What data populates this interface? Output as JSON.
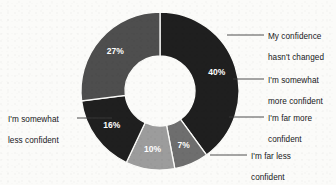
{
  "chart_data": {
    "type": "pie",
    "variant": "donut",
    "title": "",
    "subtitle": "",
    "xlabel": "",
    "ylabel": "",
    "legend_position": "callout-labels",
    "grid": false,
    "value_suffix": "%",
    "categories": [
      "My confidence hasn't changed",
      "I'm somewhat more confident",
      "I'm far more confident",
      "I'm far less confident",
      "I'm somewhat less confident"
    ],
    "values": [
      40,
      7,
      10,
      16,
      27
    ],
    "value_labels": [
      "40%",
      "7%",
      "10%",
      "16%",
      "27%"
    ],
    "colors": [
      "#1f1f1f",
      "#6e6e6e",
      "#9c9c9c",
      "#1f1f1f",
      "#4e4e4e"
    ],
    "slices": [
      {
        "label": "My confidence hasn't changed",
        "label_line1": "My confidence",
        "label_line2": "hasn't changed",
        "value": 40,
        "value_label": "40%",
        "color": "#1f1f1f",
        "start_angle": 0,
        "end_angle": 144
      },
      {
        "label": "I'm somewhat more confident",
        "label_line1": "I'm somewhat",
        "label_line2": "more confident",
        "value": 7,
        "value_label": "7%",
        "color": "#6e6e6e",
        "start_angle": 144,
        "end_angle": 169.2
      },
      {
        "label": "I'm far more confident",
        "label_line1": "I'm far more",
        "label_line2": "confident",
        "value": 10,
        "value_label": "10%",
        "color": "#9c9c9c",
        "start_angle": 169.2,
        "end_angle": 205.2
      },
      {
        "label": "I'm far less confident",
        "label_line1": "I'm far less",
        "label_line2": "confident",
        "value": 16,
        "value_label": "16%",
        "color": "#1f1f1f",
        "start_angle": 205.2,
        "end_angle": 262.8
      },
      {
        "label": "I'm somewhat less confident",
        "label_line1": "I'm somewhat",
        "label_line2": "less confident",
        "value": 27,
        "value_label": "27%",
        "color": "#4e4e4e",
        "start_angle": 262.8,
        "end_angle": 360
      }
    ],
    "background_color": "#fbfbf9",
    "label_text_color": "#17171a",
    "value_text_color": "#ffffff",
    "leader_line_color": "#3a3a3a"
  }
}
